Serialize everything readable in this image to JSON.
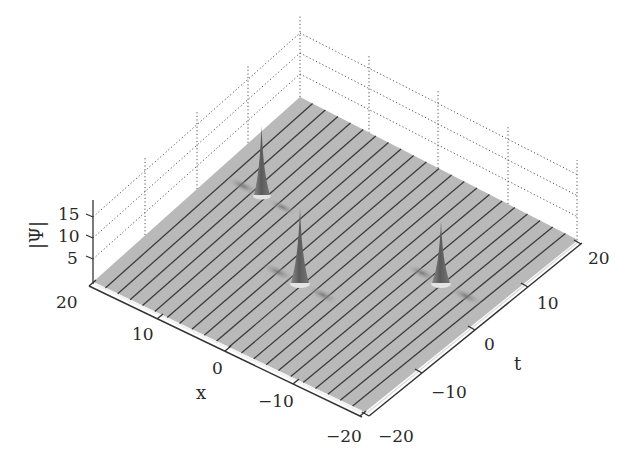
{
  "chart_data": {
    "type": "surface3d",
    "title": "",
    "xlabel": "x",
    "ylabel": "t",
    "zlabel": "|Ψ|",
    "x_range": [
      -20,
      20
    ],
    "t_range": [
      -20,
      20
    ],
    "z_range": [
      0,
      17
    ],
    "x_ticks": [
      "20",
      "10",
      "0",
      "−10",
      "−20"
    ],
    "t_ticks": [
      "−20",
      "−10",
      "0",
      "10",
      "20"
    ],
    "z_ticks": [
      "5",
      "10",
      "15"
    ],
    "grid": "dotted back walls",
    "background_level": 1,
    "surface_color": "#b8b8b8",
    "mesh_line_color": "#3a3a3a",
    "peaks": [
      {
        "x": 14,
        "t": 4,
        "height": 15
      },
      {
        "x": 0,
        "t": -6,
        "height": 17
      },
      {
        "x": -12,
        "t": 4,
        "height": 15
      }
    ]
  },
  "labels": {
    "z_title": "|Ψ|",
    "x_title": "x",
    "t_title": "t",
    "z_tick_15": "15",
    "z_tick_10": "10",
    "z_tick_5": "5",
    "x_tick_20": "20",
    "x_tick_10": "10",
    "x_tick_0": "0",
    "x_tick_m10": "−10",
    "x_tick_m20": "−20",
    "t_tick_m20": "−20",
    "t_tick_m10": "−10",
    "t_tick_0": "0",
    "t_tick_10": "10",
    "t_tick_20": "20"
  }
}
